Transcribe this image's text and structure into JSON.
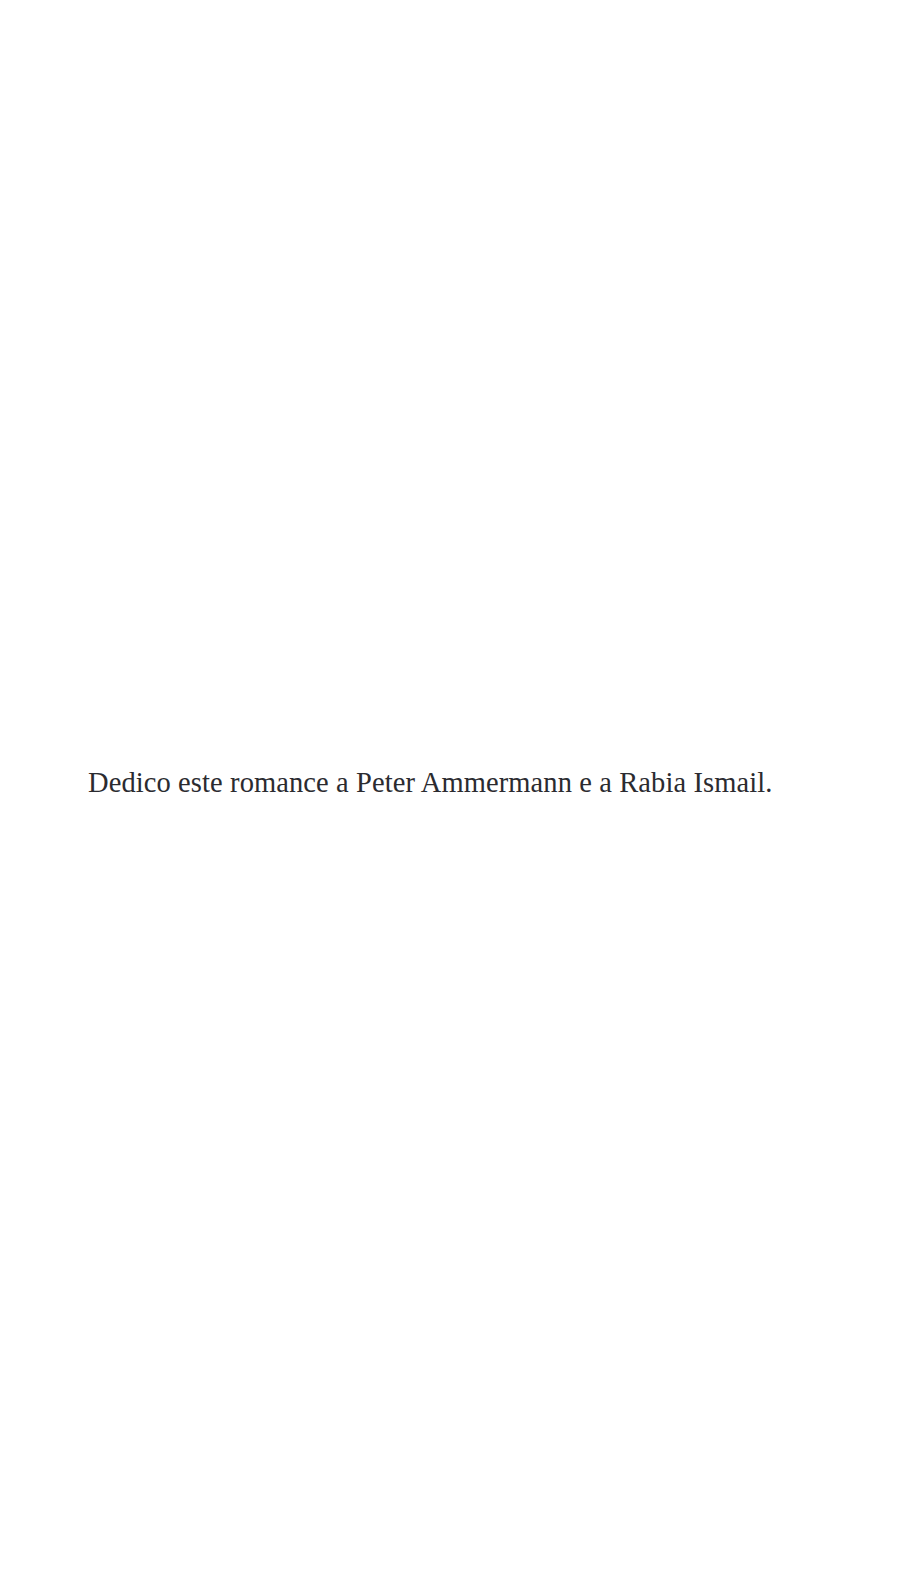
{
  "page": {
    "kind": "book-dedication-page",
    "background_color": "#ffffff",
    "text_color": "#2b2b30",
    "width_px": 913,
    "height_px": 1586
  },
  "dedication": {
    "text": "Dedico este romance a Peter Ammermann e a Rabia Ismail.",
    "language": "pt",
    "alignment": "left",
    "dedicatees": [
      "Peter Ammermann",
      "Rabia Ismail"
    ]
  },
  "artifacts": {
    "scan_speck_color": "#f2f2f2"
  }
}
